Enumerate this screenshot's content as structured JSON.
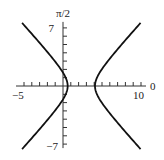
{
  "chart_data": {
    "type": "line",
    "title": "",
    "curve": "hyperbola",
    "center_x": 2.35,
    "a": 1.75,
    "b": 1.8,
    "xlim": [
      -5,
      10
    ],
    "ylim": [
      -7,
      7
    ],
    "x_tick_step": 1,
    "y_tick_step": 1,
    "x_tick_labels": [
      "-5",
      "10"
    ],
    "y_tick_labels": [
      "7",
      "-7"
    ],
    "x_axis_end_label": "0",
    "y_axis_end_label": "π/2",
    "grid": false,
    "legend": "none"
  },
  "labels": {
    "x_min": "−5",
    "x_max": "10",
    "y_max": "7",
    "y_min": "−7",
    "polar_zero": "0",
    "polar_half_pi": "π/2"
  }
}
